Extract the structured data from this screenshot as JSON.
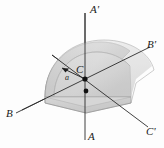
{
  "figure": {
    "type": "engineering-diagram",
    "background_color": "#fdfdfd",
    "labels": {
      "axis_a_top": "A'",
      "axis_a_bottom": "A",
      "axis_b_left": "B",
      "axis_b_right": "B'",
      "axis_c_right": "C'",
      "center_point": "C",
      "radius_dimension": "a"
    },
    "colors": {
      "line": "#2b2b2b",
      "body_top": "#d9d9d9",
      "body_face": "#c9c9c9",
      "body_rim": "#bdbdbd",
      "body_edge": "#8c8c8c",
      "dot": "#111111"
    },
    "geometry": {
      "center_x": 85,
      "center_y": 79,
      "second_dot_x": 86,
      "second_dot_y": 91,
      "radius_px": 40
    }
  }
}
